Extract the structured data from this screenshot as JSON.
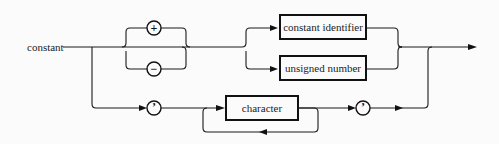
{
  "diagram": {
    "type": "syntax-diagram",
    "start_label": "constant",
    "sign_terminals": [
      {
        "symbol": "+",
        "name": "plus"
      },
      {
        "symbol": "−",
        "name": "minus"
      }
    ],
    "nonterminals": [
      {
        "label": "constant identifier"
      },
      {
        "label": "unsigned number"
      },
      {
        "label": "character"
      }
    ],
    "quote_terminals": [
      {
        "symbol": "’",
        "name": "open-quote"
      },
      {
        "symbol": "’",
        "name": "close-quote"
      }
    ],
    "colors": {
      "background": "#fbfbfb",
      "line": "#111111"
    }
  }
}
